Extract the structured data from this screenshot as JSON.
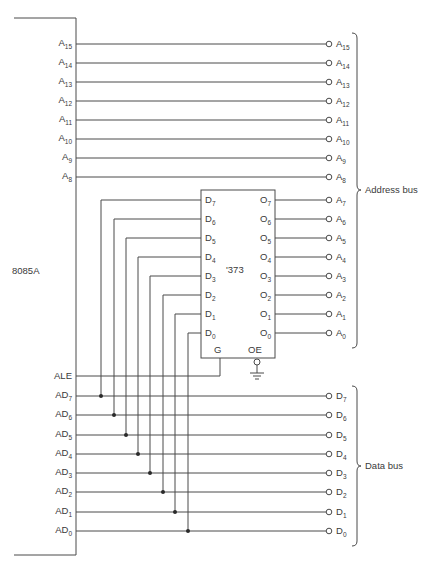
{
  "diagram": {
    "cpu": {
      "label": "8085A",
      "address_pins": [
        {
          "name": "A",
          "sub": "15"
        },
        {
          "name": "A",
          "sub": "14"
        },
        {
          "name": "A",
          "sub": "13"
        },
        {
          "name": "A",
          "sub": "12"
        },
        {
          "name": "A",
          "sub": "11"
        },
        {
          "name": "A",
          "sub": "10"
        },
        {
          "name": "A",
          "sub": "9"
        },
        {
          "name": "A",
          "sub": "8"
        }
      ],
      "ale_label": "ALE",
      "ad_pins": [
        {
          "name": "AD",
          "sub": "7"
        },
        {
          "name": "AD",
          "sub": "6"
        },
        {
          "name": "AD",
          "sub": "5"
        },
        {
          "name": "AD",
          "sub": "4"
        },
        {
          "name": "AD",
          "sub": "3"
        },
        {
          "name": "AD",
          "sub": "2"
        },
        {
          "name": "AD",
          "sub": "1"
        },
        {
          "name": "AD",
          "sub": "0"
        }
      ]
    },
    "latch": {
      "label": "'373",
      "d_pins": [
        {
          "name": "D",
          "sub": "7"
        },
        {
          "name": "D",
          "sub": "6"
        },
        {
          "name": "D",
          "sub": "5"
        },
        {
          "name": "D",
          "sub": "4"
        },
        {
          "name": "D",
          "sub": "3"
        },
        {
          "name": "D",
          "sub": "2"
        },
        {
          "name": "D",
          "sub": "1"
        },
        {
          "name": "D",
          "sub": "0"
        }
      ],
      "q_pins": [
        {
          "name": "O",
          "sub": "7"
        },
        {
          "name": "O",
          "sub": "6"
        },
        {
          "name": "O",
          "sub": "5"
        },
        {
          "name": "O",
          "sub": "4"
        },
        {
          "name": "O",
          "sub": "3"
        },
        {
          "name": "O",
          "sub": "2"
        },
        {
          "name": "O",
          "sub": "1"
        },
        {
          "name": "O",
          "sub": "0"
        }
      ],
      "g_label": "G",
      "oe_label": "OE"
    },
    "address_bus_outputs": [
      {
        "name": "A",
        "sub": "15"
      },
      {
        "name": "A",
        "sub": "14"
      },
      {
        "name": "A",
        "sub": "13"
      },
      {
        "name": "A",
        "sub": "12"
      },
      {
        "name": "A",
        "sub": "11"
      },
      {
        "name": "A",
        "sub": "10"
      },
      {
        "name": "A",
        "sub": "9"
      },
      {
        "name": "A",
        "sub": "8"
      },
      {
        "name": "A",
        "sub": "7"
      },
      {
        "name": "A",
        "sub": "6"
      },
      {
        "name": "A",
        "sub": "5"
      },
      {
        "name": "A",
        "sub": "4"
      },
      {
        "name": "A",
        "sub": "3"
      },
      {
        "name": "A",
        "sub": "2"
      },
      {
        "name": "A",
        "sub": "1"
      },
      {
        "name": "A",
        "sub": "0"
      }
    ],
    "data_bus_outputs": [
      {
        "name": "D",
        "sub": "7"
      },
      {
        "name": "D",
        "sub": "6"
      },
      {
        "name": "D",
        "sub": "5"
      },
      {
        "name": "D",
        "sub": "4"
      },
      {
        "name": "D",
        "sub": "3"
      },
      {
        "name": "D",
        "sub": "2"
      },
      {
        "name": "D",
        "sub": "1"
      },
      {
        "name": "D",
        "sub": "0"
      }
    ],
    "address_bus_label": "Address bus",
    "data_bus_label": "Data bus"
  }
}
